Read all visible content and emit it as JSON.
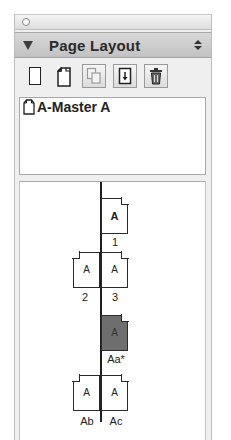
{
  "palette": {
    "title": "Page Layout"
  },
  "toolbar": {
    "buttons": [
      {
        "name": "new-page",
        "icon": "blank-page-icon"
      },
      {
        "name": "new-master",
        "icon": "folded-page-icon"
      },
      {
        "name": "duplicate",
        "icon": "duplicate-page-icon"
      },
      {
        "name": "apply-master",
        "icon": "apply-master-icon"
      },
      {
        "name": "delete",
        "icon": "trash-icon"
      }
    ]
  },
  "masters": {
    "items": [
      {
        "label": "A-Master A"
      }
    ]
  },
  "pages": {
    "items": [
      {
        "letter": "A",
        "label": "1",
        "side": "right",
        "type": "master"
      },
      {
        "letter": "A",
        "label": "2",
        "side": "left"
      },
      {
        "letter": "A",
        "label": "3",
        "side": "right"
      },
      {
        "letter": "A",
        "label": "Aa*",
        "side": "right",
        "selected": true
      },
      {
        "letter": "A",
        "label": "Ab",
        "side": "left"
      },
      {
        "letter": "A",
        "label": "Ac",
        "side": "right"
      }
    ]
  }
}
